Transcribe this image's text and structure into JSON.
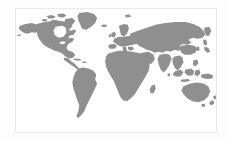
{
  "page": {
    "background_color": "#fdfdfd"
  },
  "card": {
    "background_color": "#ffffff",
    "border_color": "#eceaea"
  },
  "map": {
    "name": "world-map",
    "projection": "equirectangular",
    "land_color": "#8f8f8f",
    "ocean_color": "#ffffff",
    "includes_antarctica": false,
    "graticule": false,
    "labels": false,
    "title": "",
    "regions": [
      {
        "id": "north-america",
        "label": "North America"
      },
      {
        "id": "greenland",
        "label": "Greenland"
      },
      {
        "id": "central-america",
        "label": "Central America"
      },
      {
        "id": "south-america",
        "label": "South America"
      },
      {
        "id": "europe",
        "label": "Europe"
      },
      {
        "id": "british-isles",
        "label": "British Isles"
      },
      {
        "id": "scandinavia",
        "label": "Scandinavia"
      },
      {
        "id": "africa",
        "label": "Africa"
      },
      {
        "id": "madagascar",
        "label": "Madagascar"
      },
      {
        "id": "asia",
        "label": "Asia"
      },
      {
        "id": "japan",
        "label": "Japan"
      },
      {
        "id": "indonesia",
        "label": "Indonesia"
      },
      {
        "id": "philippines",
        "label": "Philippines"
      },
      {
        "id": "australia",
        "label": "Australia"
      },
      {
        "id": "new-zealand",
        "label": "New Zealand"
      },
      {
        "id": "iceland",
        "label": "Iceland"
      },
      {
        "id": "caribbean",
        "label": "Caribbean"
      },
      {
        "id": "canadian-arctic",
        "label": "Canadian Arctic Archipelago"
      },
      {
        "id": "sri-lanka",
        "label": "Sri Lanka"
      },
      {
        "id": "new-guinea",
        "label": "New Guinea"
      }
    ]
  }
}
